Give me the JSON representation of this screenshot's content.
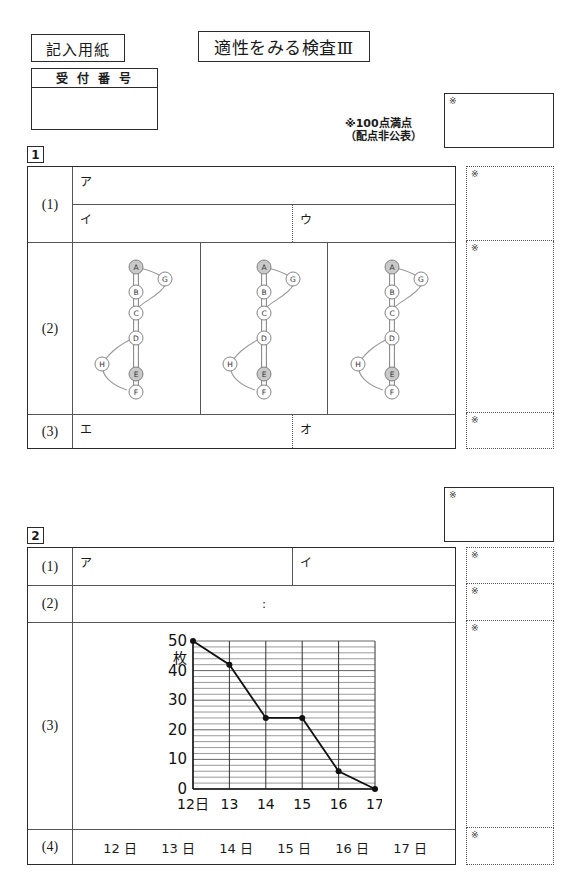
{
  "header": {
    "sheet_label": "記入用紙",
    "exam_title": "適性をみる検査Ⅲ",
    "receipt_label": "受 付 番 号",
    "score_note_line1": "※100点満点",
    "score_note_line2": "（配点非公表）",
    "kome": "※"
  },
  "section1": {
    "number": "1",
    "rows": {
      "r1_num": "(1)",
      "r1_a": "ア",
      "r1_i": "イ",
      "r1_u": "ウ",
      "r2_num": "(2)",
      "r3_num": "(3)",
      "r3_e": "エ",
      "r3_o": "オ"
    },
    "diagram": {
      "nodes": [
        "A",
        "B",
        "C",
        "D",
        "E",
        "F",
        "G",
        "H"
      ],
      "shaded_nodes": [
        "A",
        "E"
      ],
      "panel_count": 3
    }
  },
  "section2": {
    "number": "2",
    "rows": {
      "r1_num": "(1)",
      "r1_a": "ア",
      "r1_i": "イ",
      "r2_num": "(2)",
      "r2_colon": ":",
      "r3_num": "(3)",
      "r4_num": "(4)",
      "days": [
        "12 日",
        "13 日",
        "14 日",
        "15 日",
        "16 日",
        "17 日"
      ]
    }
  },
  "chart_data": {
    "type": "line",
    "title": "",
    "xlabel": "",
    "ylabel": "枚",
    "categories": [
      "12日",
      "13",
      "14",
      "15",
      "16",
      "17"
    ],
    "x_tick_labels": [
      "12日",
      "13",
      "14",
      "15",
      "16",
      "17"
    ],
    "y_tick_labels": [
      "0",
      "10",
      "20",
      "30",
      "40",
      "50"
    ],
    "y_ticks": [
      0,
      10,
      20,
      30,
      40,
      50
    ],
    "values": [
      50,
      42,
      24,
      24,
      6,
      0
    ],
    "ylim": [
      0,
      50
    ],
    "grid": true,
    "grid_minor_step": 2,
    "legend": "none",
    "marker": "filled-circle"
  }
}
